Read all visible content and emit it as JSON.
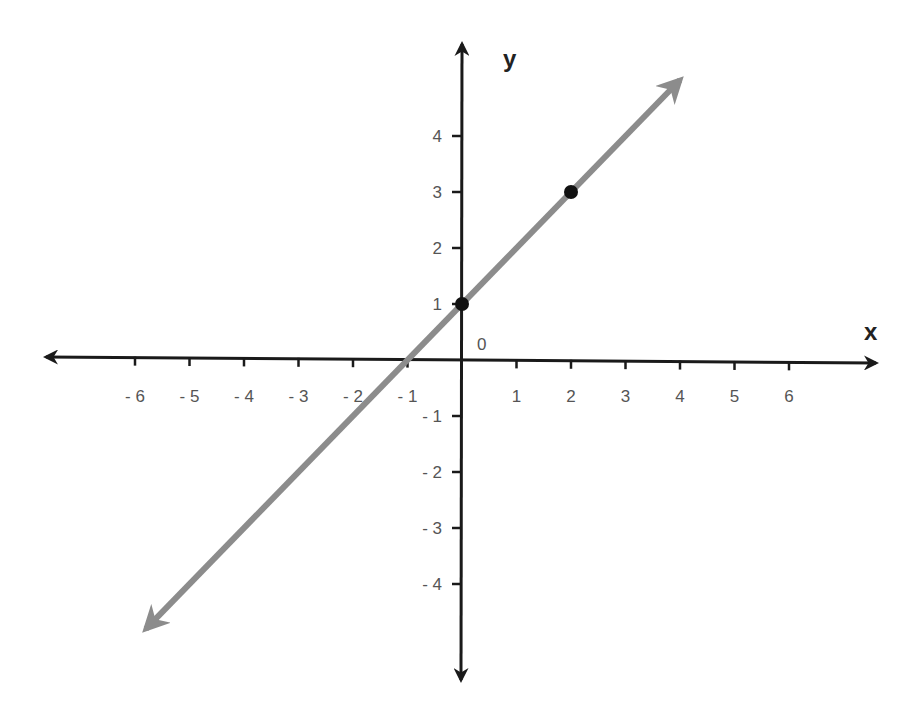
{
  "chart_data": {
    "type": "line",
    "title": "",
    "xlabel": "x",
    "ylabel": "y",
    "origin_label": "0",
    "xlim": [
      -6,
      6
    ],
    "ylim": [
      -4,
      4
    ],
    "grid": false,
    "x_ticks": [
      -6,
      -5,
      -4,
      -3,
      -2,
      -1,
      1,
      2,
      3,
      4,
      5,
      6
    ],
    "x_tick_labels": [
      "- 6",
      "- 5",
      "- 4",
      "- 3",
      "- 2",
      "- 1",
      "1",
      "2",
      "3",
      "4",
      "5",
      "6"
    ],
    "y_ticks": [
      4,
      3,
      2,
      1,
      -1,
      -2,
      -3,
      -4
    ],
    "y_tick_labels": [
      "4",
      "3",
      "2",
      "1",
      "- 1",
      "- 2",
      "- 3",
      "- 4"
    ],
    "series": [
      {
        "name": "line",
        "equation": "y = x + 1",
        "slope": 1,
        "intercept": 1,
        "x_range_shown": [
          -5.8,
          4.0
        ],
        "color": "#8c8c8c",
        "arrows_both_ends": true
      }
    ],
    "points": [
      {
        "x": 0,
        "y": 1,
        "color": "#111111"
      },
      {
        "x": 2,
        "y": 3,
        "color": "#111111"
      }
    ],
    "axis_color": "#1a1a1a"
  }
}
